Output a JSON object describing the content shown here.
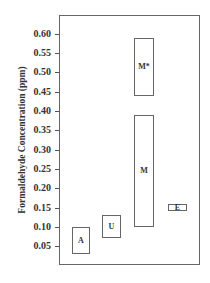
{
  "chart_data": {
    "type": "bar",
    "subtype": "floating-range",
    "title": "",
    "xlabel": "",
    "ylabel": "Formaldehyde Concentration (ppm)",
    "ylim": [
      0.0,
      0.65
    ],
    "yticks": [
      "0.05",
      "0.10",
      "0.15",
      "0.20",
      "0.25",
      "0.30",
      "0.35",
      "0.40",
      "0.45",
      "0.50",
      "0.55",
      "0.60"
    ],
    "grid": false,
    "legend": null,
    "categories": [
      "A",
      "U",
      "M",
      "M*",
      "E"
    ],
    "series": [
      {
        "name": "low",
        "values": [
          0.03,
          0.07,
          0.1,
          0.44,
          0.14
        ]
      },
      {
        "name": "high",
        "values": [
          0.1,
          0.13,
          0.39,
          0.59,
          0.16
        ]
      }
    ]
  }
}
